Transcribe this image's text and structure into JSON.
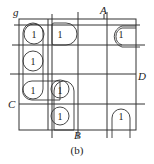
{
  "diagram": {
    "type": "karnaugh-map",
    "variable_labels": {
      "top_left": "g",
      "top": "A",
      "right": "D",
      "left": "C",
      "bottom": "B"
    },
    "caption": "(b)",
    "cell_value": "1",
    "grid_rows": 4,
    "grid_cols": 4,
    "ones": [
      {
        "row": 0,
        "col": 0,
        "label": "1"
      },
      {
        "row": 0,
        "col": 1,
        "label": "1"
      },
      {
        "row": 0,
        "col": 3,
        "label": "1"
      },
      {
        "row": 1,
        "col": 0,
        "label": "1"
      },
      {
        "row": 2,
        "col": 0,
        "label": "1"
      },
      {
        "row": 2,
        "col": 1,
        "label": "1"
      },
      {
        "row": 3,
        "col": 1,
        "label": "1"
      },
      {
        "row": 3,
        "col": 3,
        "label": "1"
      }
    ]
  }
}
